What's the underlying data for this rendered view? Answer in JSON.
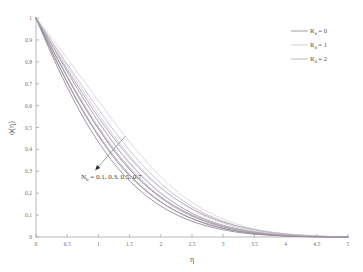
{
  "chart_data": {
    "type": "line",
    "title": "",
    "subtitle": "",
    "xlabel": "η",
    "ylabel": "ϕ(η)",
    "xlim": [
      0,
      5
    ],
    "ylim": [
      0,
      1
    ],
    "grid": false,
    "legend_position": "top-right",
    "x_ticks": [
      "0",
      "0.5",
      "1",
      "1.5",
      "2",
      "2.5",
      "3",
      "3.5",
      "4",
      "4.5",
      "5"
    ],
    "x_tick_values": [
      0,
      0.5,
      1,
      1.5,
      2,
      2.5,
      3,
      3.5,
      4,
      4.5,
      5
    ],
    "y_ticks": [
      "0",
      "0.1",
      "0.2",
      "0.3",
      "0.4",
      "0.5",
      "0.6",
      "0.7",
      "0.8",
      "0.9",
      "1"
    ],
    "y_tick_values": [
      0,
      0.1,
      0.2,
      0.3,
      0.4,
      0.5,
      0.6,
      0.7,
      0.8,
      0.9,
      1
    ],
    "annotations": [
      {
        "name": "nb-sweep-annotation",
        "text_main": "N",
        "text_sub": "b",
        "text_rest": " = 0.1, 0.3, 0.5, 0.7",
        "x": 0.72,
        "y": 0.265,
        "arrow_from": [
          1.43,
          0.46
        ],
        "arrow_to": [
          0.95,
          0.305
        ]
      }
    ],
    "legend": [
      {
        "label_main": "R",
        "label_sub": "d",
        "label_rest": " = 0",
        "color": "#8c8290"
      },
      {
        "label_main": "R",
        "label_sub": "d",
        "label_rest": " = 1",
        "color": "#c9c3cc"
      },
      {
        "label_main": "R",
        "label_sub": "d",
        "label_rest": " = 2",
        "color": "#b0a8b4"
      }
    ],
    "x": [
      0,
      0.1,
      0.2,
      0.3,
      0.4,
      0.5,
      0.6,
      0.7,
      0.8,
      0.9,
      1.0,
      1.2,
      1.4,
      1.6,
      1.8,
      2.0,
      2.2,
      2.4,
      2.6,
      2.8,
      3.0,
      3.25,
      3.5,
      3.75,
      4.0,
      4.25,
      4.5,
      4.75,
      5.0
    ],
    "series": [
      {
        "name": "Rd = 0, Nb = 0.1",
        "group": "Rd=0",
        "nb": 0.1,
        "color": "#9a90a0",
        "width": 0.75,
        "values": [
          1.0,
          0.952,
          0.905,
          0.858,
          0.812,
          0.766,
          0.721,
          0.676,
          0.632,
          0.589,
          0.547,
          0.468,
          0.396,
          0.331,
          0.274,
          0.224,
          0.181,
          0.145,
          0.114,
          0.089,
          0.068,
          0.048,
          0.033,
          0.022,
          0.014,
          0.009,
          0.005,
          0.002,
          0.0
        ]
      },
      {
        "name": "Rd = 0, Nb = 0.3",
        "group": "Rd=0",
        "nb": 0.3,
        "color": "#8f8596",
        "width": 0.75,
        "values": [
          1.0,
          0.944,
          0.889,
          0.835,
          0.782,
          0.73,
          0.679,
          0.63,
          0.583,
          0.537,
          0.494,
          0.413,
          0.342,
          0.28,
          0.227,
          0.182,
          0.145,
          0.114,
          0.088,
          0.067,
          0.05,
          0.034,
          0.022,
          0.014,
          0.008,
          0.005,
          0.002,
          0.001,
          0.0
        ]
      },
      {
        "name": "Rd = 0, Nb = 0.5",
        "group": "Rd=0",
        "nb": 0.5,
        "color": "#867b8e",
        "width": 0.75,
        "values": [
          1.0,
          0.938,
          0.877,
          0.818,
          0.761,
          0.705,
          0.651,
          0.6,
          0.551,
          0.505,
          0.461,
          0.38,
          0.31,
          0.251,
          0.201,
          0.159,
          0.125,
          0.097,
          0.074,
          0.055,
          0.04,
          0.026,
          0.017,
          0.01,
          0.006,
          0.003,
          0.001,
          0.0,
          0.0
        ]
      },
      {
        "name": "Rd = 0, Nb = 0.7",
        "group": "Rd=0",
        "nb": 0.7,
        "color": "#7d7285",
        "width": 0.75,
        "values": [
          1.0,
          0.932,
          0.866,
          0.803,
          0.742,
          0.684,
          0.628,
          0.575,
          0.525,
          0.478,
          0.434,
          0.354,
          0.286,
          0.229,
          0.181,
          0.141,
          0.109,
          0.083,
          0.062,
          0.046,
          0.033,
          0.021,
          0.013,
          0.008,
          0.004,
          0.002,
          0.001,
          0.0,
          0.0
        ]
      },
      {
        "name": "Rd = 1, Nb = 0.1",
        "group": "Rd=1",
        "nb": 0.1,
        "color": "#d4cfd7",
        "width": 0.75,
        "values": [
          1.0,
          0.964,
          0.928,
          0.891,
          0.854,
          0.816,
          0.778,
          0.739,
          0.7,
          0.661,
          0.622,
          0.545,
          0.47,
          0.399,
          0.334,
          0.275,
          0.223,
          0.178,
          0.14,
          0.108,
          0.082,
          0.056,
          0.037,
          0.024,
          0.014,
          0.008,
          0.004,
          0.002,
          0.0
        ]
      },
      {
        "name": "Rd = 1, Nb = 0.3",
        "group": "Rd=1",
        "nb": 0.3,
        "color": "#cbc5cf",
        "width": 0.75,
        "values": [
          1.0,
          0.957,
          0.913,
          0.869,
          0.825,
          0.78,
          0.735,
          0.691,
          0.647,
          0.604,
          0.562,
          0.481,
          0.406,
          0.339,
          0.279,
          0.226,
          0.181,
          0.142,
          0.11,
          0.084,
          0.063,
          0.042,
          0.027,
          0.017,
          0.01,
          0.005,
          0.002,
          0.001,
          0.0
        ]
      },
      {
        "name": "Rd = 1, Nb = 0.5",
        "group": "Rd=1",
        "nb": 0.5,
        "color": "#c0b9c5",
        "width": 0.75,
        "values": [
          1.0,
          0.951,
          0.902,
          0.853,
          0.804,
          0.756,
          0.708,
          0.661,
          0.616,
          0.571,
          0.528,
          0.447,
          0.373,
          0.308,
          0.251,
          0.201,
          0.159,
          0.124,
          0.095,
          0.072,
          0.053,
          0.035,
          0.022,
          0.013,
          0.008,
          0.004,
          0.002,
          0.001,
          0.0
        ]
      },
      {
        "name": "Rd = 1, Nb = 0.7",
        "group": "Rd=1",
        "nb": 0.7,
        "color": "#b6aebb",
        "width": 0.75,
        "values": [
          1.0,
          0.946,
          0.892,
          0.839,
          0.787,
          0.736,
          0.686,
          0.638,
          0.591,
          0.546,
          0.503,
          0.422,
          0.349,
          0.286,
          0.231,
          0.184,
          0.144,
          0.111,
          0.085,
          0.063,
          0.046,
          0.03,
          0.019,
          0.011,
          0.006,
          0.003,
          0.001,
          0.0,
          0.0
        ]
      },
      {
        "name": "Rd = 2, Nb = 0.1",
        "group": "Rd=2",
        "nb": 0.1,
        "color": "#bab2be",
        "width": 0.75,
        "values": [
          1.0,
          0.958,
          0.916,
          0.874,
          0.832,
          0.79,
          0.748,
          0.707,
          0.665,
          0.624,
          0.584,
          0.505,
          0.431,
          0.362,
          0.3,
          0.245,
          0.197,
          0.157,
          0.123,
          0.095,
          0.072,
          0.049,
          0.033,
          0.021,
          0.013,
          0.007,
          0.003,
          0.001,
          0.0
        ]
      },
      {
        "name": "Rd = 2, Nb = 0.3",
        "group": "Rd=2",
        "nb": 0.3,
        "color": "#aea5b3",
        "width": 0.75,
        "values": [
          1.0,
          0.951,
          0.902,
          0.853,
          0.804,
          0.755,
          0.707,
          0.66,
          0.614,
          0.569,
          0.526,
          0.444,
          0.37,
          0.305,
          0.248,
          0.199,
          0.158,
          0.123,
          0.095,
          0.072,
          0.054,
          0.036,
          0.023,
          0.014,
          0.008,
          0.004,
          0.002,
          0.001,
          0.0
        ]
      },
      {
        "name": "Rd = 2, Nb = 0.5",
        "group": "Rd=2",
        "nb": 0.5,
        "color": "#a39aa8",
        "width": 0.75,
        "values": [
          1.0,
          0.945,
          0.89,
          0.836,
          0.783,
          0.731,
          0.68,
          0.631,
          0.584,
          0.538,
          0.495,
          0.413,
          0.341,
          0.278,
          0.224,
          0.178,
          0.14,
          0.108,
          0.083,
          0.062,
          0.046,
          0.03,
          0.019,
          0.011,
          0.006,
          0.003,
          0.001,
          0.0,
          0.0
        ]
      },
      {
        "name": "Rd = 2, Nb = 0.7",
        "group": "Rd=2",
        "nb": 0.7,
        "color": "#978d9d",
        "width": 0.75,
        "values": [
          1.0,
          0.939,
          0.879,
          0.821,
          0.764,
          0.709,
          0.656,
          0.605,
          0.557,
          0.511,
          0.468,
          0.387,
          0.317,
          0.256,
          0.205,
          0.161,
          0.125,
          0.096,
          0.072,
          0.053,
          0.039,
          0.025,
          0.015,
          0.009,
          0.005,
          0.002,
          0.001,
          0.0,
          0.0
        ]
      }
    ]
  },
  "figure": {
    "background_color": "#ffffff",
    "axis_color": "#9a9a9a",
    "frame": {
      "left": 36,
      "top": 18,
      "right": 348,
      "bottom": 237
    }
  }
}
